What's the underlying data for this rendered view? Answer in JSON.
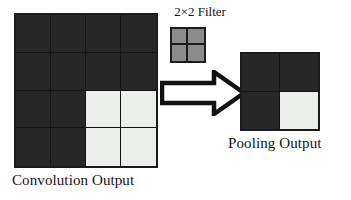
{
  "diagram": {
    "background_color": "#ffffff",
    "colors": {
      "dark_cell": "#272727",
      "light_cell": "#eceeec",
      "filter_cell": "#8b8b8b",
      "border": "#1b1b1b",
      "text": "#131313"
    }
  },
  "convolution_output": {
    "caption": "Convolution Output",
    "rows": 4,
    "cols": 4,
    "cells": [
      [
        "dark",
        "dark",
        "dark",
        "dark"
      ],
      [
        "dark",
        "dark",
        "dark",
        "dark"
      ],
      [
        "dark",
        "dark",
        "light",
        "light"
      ],
      [
        "dark",
        "dark",
        "light",
        "light"
      ]
    ]
  },
  "filter": {
    "label": "2×2 Filter",
    "rows": 2,
    "cols": 2,
    "cells": [
      [
        "gray",
        "gray"
      ],
      [
        "gray",
        "gray"
      ]
    ]
  },
  "arrow": {
    "name": "right-block-arrow",
    "direction": "right",
    "fill": "#ffffff",
    "stroke": "#111111"
  },
  "pooling_output": {
    "caption": "Pooling Output",
    "rows": 2,
    "cols": 2,
    "cells": [
      [
        "dark",
        "dark"
      ],
      [
        "dark",
        "light"
      ]
    ]
  }
}
